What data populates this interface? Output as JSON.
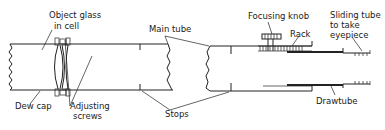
{
  "diagram": {
    "labels": {
      "object_glass_line1": "Object glass",
      "object_glass_line2": "in cell",
      "dew_cap": "Dew cap",
      "adjusting_line1": "Adjusting",
      "adjusting_line2": "screws",
      "main_tube": "Main tube",
      "stops": "Stops",
      "focusing_knob": "Focusing knob",
      "rack": "Rack",
      "sliding_line1": "Sliding tube",
      "sliding_line2": "to take",
      "sliding_line3": "eyepiece",
      "drawtube": "Drawtube"
    },
    "colors": {
      "line": "#222222",
      "background": "#ffffff"
    }
  }
}
